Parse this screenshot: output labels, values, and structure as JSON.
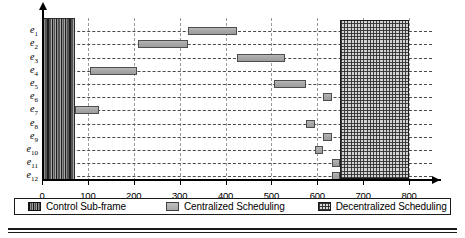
{
  "chart_data": {
    "type": "bar",
    "title": "",
    "subtitle": "",
    "xlabel": "",
    "ylabel": "",
    "xlim": [
      0,
      850
    ],
    "ylim": [
      0,
      12
    ],
    "grid": true,
    "orientation": "horizontal",
    "legend_position": "bottom",
    "x_ticks": [
      0,
      100,
      200,
      300,
      400,
      500,
      600,
      700,
      800
    ],
    "x_tick_labels": [
      "0",
      "100",
      "200",
      "300",
      "400",
      "500",
      "600",
      "700",
      "800"
    ],
    "categories": [
      "e1",
      "e2",
      "e3",
      "e4",
      "e5",
      "e6",
      "e7",
      "e8",
      "e9",
      "e10",
      "e11",
      "e12"
    ],
    "category_labels": [
      {
        "base": "e",
        "sub": "1"
      },
      {
        "base": "e",
        "sub": "2"
      },
      {
        "base": "e",
        "sub": "3"
      },
      {
        "base": "e",
        "sub": "4"
      },
      {
        "base": "e",
        "sub": "5"
      },
      {
        "base": "e",
        "sub": "6"
      },
      {
        "base": "e",
        "sub": "7"
      },
      {
        "base": "e",
        "sub": "8"
      },
      {
        "base": "e",
        "sub": "9"
      },
      {
        "base": "e",
        "sub": "10"
      },
      {
        "base": "e",
        "sub": "11"
      },
      {
        "base": "e",
        "sub": "12"
      }
    ],
    "series": [
      {
        "name": "Control Sub-frame",
        "type": "span-all-rows",
        "color": "#1e1e1e",
        "pattern": "dark-vertical-stripes",
        "start": 0,
        "end": 72
      },
      {
        "name": "Centralized Scheduling",
        "type": "gantt-bars",
        "color": "#a7a7a7",
        "pattern": "solid-gray",
        "bars": [
          {
            "row": "e1",
            "start": 318,
            "end": 425
          },
          {
            "row": "e2",
            "start": 210,
            "end": 318
          },
          {
            "row": "e3",
            "start": 425,
            "end": 530
          },
          {
            "row": "e4",
            "start": 105,
            "end": 208
          },
          {
            "row": "e5",
            "start": 505,
            "end": 575
          },
          {
            "row": "e6",
            "start": 612,
            "end": 632
          },
          {
            "row": "e7",
            "start": 72,
            "end": 124
          },
          {
            "row": "e8",
            "start": 575,
            "end": 594
          },
          {
            "row": "e9",
            "start": 613,
            "end": 633
          },
          {
            "row": "e10",
            "start": 594,
            "end": 613
          },
          {
            "row": "e11",
            "start": 633,
            "end": 650
          },
          {
            "row": "e12",
            "start": 633,
            "end": 650
          }
        ]
      },
      {
        "name": "Decentralized Scheduling",
        "type": "span-all-rows",
        "color": "#d2d2d2",
        "pattern": "cross-hatch",
        "start": 650,
        "end": 800
      }
    ]
  },
  "legend": {
    "entries": [
      {
        "label": "Control Sub-frame",
        "swatch": "control-swatch"
      },
      {
        "label": "Centralized Scheduling",
        "swatch": "centralized-swatch"
      },
      {
        "label": "Decentralized Scheduling",
        "swatch": "decentralized-swatch"
      }
    ]
  }
}
